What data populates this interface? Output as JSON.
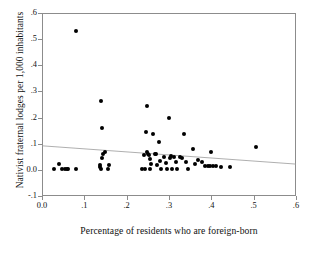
{
  "chart_data": {
    "type": "scatter",
    "title": "",
    "xlabel": "Percentage of residents who are foreign-born",
    "ylabel": "Nativist fraternal lodges per 1,000 inhabitants",
    "xlim": [
      0.0,
      0.6
    ],
    "ylim": [
      -0.1,
      0.6
    ],
    "xticks": [
      0.0,
      0.1,
      0.2,
      0.3,
      0.4,
      0.5,
      0.6
    ],
    "xtick_labels": [
      "0.0",
      ".1",
      ".2",
      ".3",
      ".4",
      ".5",
      ".6"
    ],
    "yticks": [
      -0.1,
      0.0,
      0.1,
      0.2,
      0.3,
      0.4,
      0.5,
      0.6
    ],
    "ytick_labels": [
      "-.1",
      "0.0",
      ".1",
      ".2",
      ".3",
      ".4",
      ".5",
      ".6"
    ],
    "grid": false,
    "legend": "none",
    "marker": "filled-circle",
    "marker_color": "#000000",
    "frame_color": "#8c8c8c",
    "fit_line": {
      "name": "linear fit",
      "color": "#9a9a9a",
      "x": [
        0.0,
        0.6
      ],
      "y": [
        0.092,
        0.022
      ],
      "slope": -0.117,
      "intercept": 0.092
    },
    "points": [
      {
        "x": 0.028,
        "y": 0.003
      },
      {
        "x": 0.04,
        "y": 0.022
      },
      {
        "x": 0.047,
        "y": 0.002
      },
      {
        "x": 0.054,
        "y": 0.002
      },
      {
        "x": 0.058,
        "y": 0.002
      },
      {
        "x": 0.062,
        "y": 0.002
      },
      {
        "x": 0.08,
        "y": 0.53
      },
      {
        "x": 0.081,
        "y": 0.002
      },
      {
        "x": 0.136,
        "y": 0.01
      },
      {
        "x": 0.138,
        "y": 0.02
      },
      {
        "x": 0.139,
        "y": 0.002
      },
      {
        "x": 0.14,
        "y": 0.265
      },
      {
        "x": 0.141,
        "y": 0.162
      },
      {
        "x": 0.142,
        "y": 0.046
      },
      {
        "x": 0.143,
        "y": 0.06
      },
      {
        "x": 0.148,
        "y": 0.068
      },
      {
        "x": 0.155,
        "y": 0.002
      },
      {
        "x": 0.158,
        "y": 0.02
      },
      {
        "x": 0.237,
        "y": 0.004
      },
      {
        "x": 0.24,
        "y": 0.058
      },
      {
        "x": 0.243,
        "y": 0.004
      },
      {
        "x": 0.246,
        "y": 0.143
      },
      {
        "x": 0.248,
        "y": 0.244
      },
      {
        "x": 0.249,
        "y": 0.07
      },
      {
        "x": 0.251,
        "y": 0.06
      },
      {
        "x": 0.252,
        "y": 0.055
      },
      {
        "x": 0.254,
        "y": 0.04
      },
      {
        "x": 0.256,
        "y": 0.004
      },
      {
        "x": 0.258,
        "y": 0.022
      },
      {
        "x": 0.262,
        "y": 0.136
      },
      {
        "x": 0.266,
        "y": 0.06
      },
      {
        "x": 0.27,
        "y": 0.06
      },
      {
        "x": 0.272,
        "y": 0.018
      },
      {
        "x": 0.276,
        "y": 0.105
      },
      {
        "x": 0.279,
        "y": 0.032
      },
      {
        "x": 0.282,
        "y": 0.004
      },
      {
        "x": 0.288,
        "y": 0.05
      },
      {
        "x": 0.292,
        "y": 0.028
      },
      {
        "x": 0.296,
        "y": 0.004
      },
      {
        "x": 0.3,
        "y": 0.199
      },
      {
        "x": 0.302,
        "y": 0.046
      },
      {
        "x": 0.305,
        "y": 0.052
      },
      {
        "x": 0.308,
        "y": 0.005
      },
      {
        "x": 0.312,
        "y": 0.05
      },
      {
        "x": 0.316,
        "y": 0.03
      },
      {
        "x": 0.32,
        "y": 0.005
      },
      {
        "x": 0.326,
        "y": 0.05
      },
      {
        "x": 0.33,
        "y": 0.046
      },
      {
        "x": 0.336,
        "y": 0.139
      },
      {
        "x": 0.34,
        "y": 0.03
      },
      {
        "x": 0.346,
        "y": 0.004
      },
      {
        "x": 0.356,
        "y": 0.078
      },
      {
        "x": 0.362,
        "y": 0.022
      },
      {
        "x": 0.368,
        "y": 0.036
      },
      {
        "x": 0.378,
        "y": 0.03
      },
      {
        "x": 0.386,
        "y": 0.013
      },
      {
        "x": 0.392,
        "y": 0.014
      },
      {
        "x": 0.396,
        "y": 0.016
      },
      {
        "x": 0.4,
        "y": 0.068
      },
      {
        "x": 0.404,
        "y": 0.016
      },
      {
        "x": 0.41,
        "y": 0.014
      },
      {
        "x": 0.424,
        "y": 0.01
      },
      {
        "x": 0.444,
        "y": 0.01
      },
      {
        "x": 0.505,
        "y": 0.088
      }
    ]
  }
}
